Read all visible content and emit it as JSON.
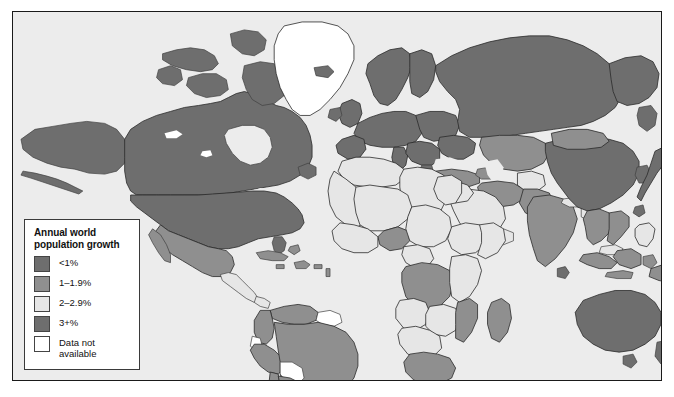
{
  "map": {
    "title": "World map of annual population growth",
    "ocean_color": "#ececec",
    "frame_color": "#1a1a1a",
    "border_color": "#3f3f3f"
  },
  "legend": {
    "title": "Annual world population growth",
    "title_line1": "Annual world",
    "title_line2": "population growth",
    "items": [
      {
        "label": "<1%",
        "color": "#6e6e6e"
      },
      {
        "label": "1–1.9%",
        "color": "#8f8f8f"
      },
      {
        "label": "2–2.9%",
        "color": "#e6e6e6"
      },
      {
        "label": "3+%",
        "color": "#6e6e6e"
      },
      {
        "label": "Data not\navailable",
        "color": "#ffffff"
      }
    ]
  },
  "regions": [
    {
      "name": "canada",
      "category": "<1%"
    },
    {
      "name": "united-states",
      "category": "<1%"
    },
    {
      "name": "alaska",
      "category": "<1%"
    },
    {
      "name": "greenland",
      "category": "Data not available"
    },
    {
      "name": "mexico",
      "category": "1–1.9%"
    },
    {
      "name": "central-america",
      "category": "2–2.9%"
    },
    {
      "name": "caribbean",
      "category": "1–1.9%"
    },
    {
      "name": "brazil",
      "category": "1–1.9%"
    },
    {
      "name": "argentina",
      "category": "1–1.9%"
    },
    {
      "name": "chile",
      "category": "1–1.9%"
    },
    {
      "name": "peru",
      "category": "1–1.9%"
    },
    {
      "name": "colombia",
      "category": "1–1.9%"
    },
    {
      "name": "venezuela",
      "category": "1–1.9%"
    },
    {
      "name": "bolivia",
      "category": "Data not available"
    },
    {
      "name": "paraguay",
      "category": "Data not available"
    },
    {
      "name": "europe",
      "category": "<1%"
    },
    {
      "name": "russia",
      "category": "<1%"
    },
    {
      "name": "scandinavia",
      "category": "<1%"
    },
    {
      "name": "north-africa",
      "category": "2–2.9%"
    },
    {
      "name": "west-africa",
      "category": "2–2.9%"
    },
    {
      "name": "central-africa",
      "category": "2–2.9%"
    },
    {
      "name": "east-africa",
      "category": "2–2.9%"
    },
    {
      "name": "southern-africa",
      "category": "2–2.9%"
    },
    {
      "name": "madagascar",
      "category": "1–1.9%"
    },
    {
      "name": "middle-east",
      "category": "2–2.9%"
    },
    {
      "name": "saudi-arabia",
      "category": "2–2.9%"
    },
    {
      "name": "turkey",
      "category": "1–1.9%"
    },
    {
      "name": "iran",
      "category": "1–1.9%"
    },
    {
      "name": "central-asia",
      "category": "1–1.9%"
    },
    {
      "name": "india",
      "category": "1–1.9%"
    },
    {
      "name": "pakistan",
      "category": "1–1.9%"
    },
    {
      "name": "china",
      "category": "<1%"
    },
    {
      "name": "mongolia",
      "category": "1–1.9%"
    },
    {
      "name": "japan",
      "category": "<1%"
    },
    {
      "name": "korea",
      "category": "<1%"
    },
    {
      "name": "southeast-asia",
      "category": "1–1.9%"
    },
    {
      "name": "indonesia",
      "category": "1–1.9%"
    },
    {
      "name": "philippines",
      "category": "2–2.9%"
    },
    {
      "name": "australia",
      "category": "<1%"
    },
    {
      "name": "new-zealand",
      "category": "<1%"
    },
    {
      "name": "papua-new-guinea",
      "category": "1–1.9%"
    }
  ]
}
